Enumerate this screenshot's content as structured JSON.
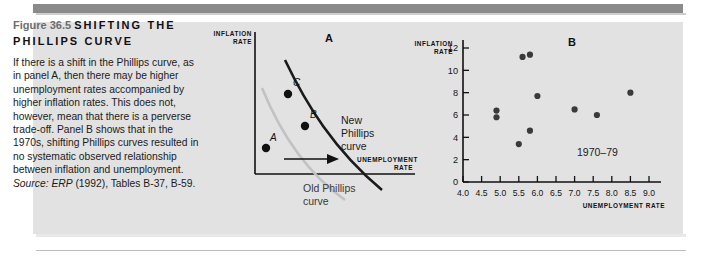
{
  "figure": {
    "number": "Figure 36.5",
    "title": "SHIFTING THE PHILLIPS CURVE",
    "body": "If there is a shift in the Phillips curve, as in panel A, then there may be higher unemployment rates accompanied by higher inflation rates. This does not, however, mean that there is a perverse trade-off. Panel B shows that in the 1970s, shifting Phillips curves resulted in no systematic observed relationship between inflation and unemployment.",
    "source_prefix": "Source:",
    "source_text": " ERP (1992), Tables B-37, B-59.",
    "source_italic": "ERP",
    "source_rest": " (1992), Tables B-37, B-59."
  },
  "panel_a": {
    "letter": "A",
    "y_axis_label": "INFLATION RATE",
    "x_axis_label": "UNEMPLOYMENT RATE",
    "new_curve_label": "New Phillips curve",
    "old_curve_label": "Old Phillips curve",
    "points": [
      {
        "label": "A"
      },
      {
        "label": "B"
      },
      {
        "label": "C"
      }
    ]
  },
  "panel_b": {
    "letter": "B",
    "y_axis_label": "INFLATION RATE",
    "x_axis_label": "UNEMPLOYMENT RATE",
    "annotation": "1970–79"
  },
  "chart_data": [
    {
      "type": "line",
      "title": "Panel A — Shifting the Phillips Curve",
      "xlabel": "UNEMPLOYMENT RATE",
      "ylabel": "INFLATION RATE",
      "grid": false,
      "legend": "inline labels",
      "series": [
        {
          "name": "Old Phillips curve",
          "color": "#b9b9b9",
          "points": [
            [
              0.14,
              0.72
            ],
            [
              0.3,
              0.46
            ],
            [
              0.5,
              0.24
            ],
            [
              0.78,
              0.08
            ]
          ]
        },
        {
          "name": "New Phillips curve",
          "color": "#1a1a1a",
          "points": [
            [
              0.3,
              0.88
            ],
            [
              0.48,
              0.62
            ],
            [
              0.68,
              0.36
            ],
            [
              0.95,
              0.12
            ]
          ]
        }
      ],
      "annotated_points": [
        {
          "label": "A",
          "series": "Old Phillips curve",
          "x": 0.3,
          "y": 0.34
        },
        {
          "label": "B",
          "series": "New Phillips curve",
          "x": 0.5,
          "y": 0.5
        },
        {
          "label": "C",
          "series": "New Phillips curve",
          "x": 0.38,
          "y": 0.68
        }
      ],
      "annotations": [
        "arrow pointing right from point A toward new curve"
      ]
    },
    {
      "type": "scatter",
      "title": "Panel B — Inflation vs Unemployment, 1970–79",
      "xlabel": "UNEMPLOYMENT RATE",
      "ylabel": "INFLATION RATE",
      "xlim": [
        4.0,
        9.0
      ],
      "ylim": [
        0,
        12
      ],
      "xticks": [
        "4.0",
        "4.5",
        "5.0",
        "5.5",
        "6.0",
        "6.5",
        "7.0",
        "7.5",
        "8.0",
        "8.5",
        "9.0"
      ],
      "yticks": [
        "0",
        "2",
        "4",
        "6",
        "8",
        "10",
        "12"
      ],
      "grid": false,
      "annotation": "1970–79",
      "x": [
        4.9,
        4.9,
        5.6,
        5.5,
        5.8,
        6.0,
        5.8,
        7.0,
        7.6,
        8.5
      ],
      "y": [
        6.4,
        5.8,
        11.2,
        3.4,
        11.4,
        7.7,
        4.6,
        6.5,
        6.0,
        8.0
      ],
      "points": [
        {
          "x": 4.9,
          "y": 6.4
        },
        {
          "x": 4.9,
          "y": 5.8
        },
        {
          "x": 5.6,
          "y": 11.2
        },
        {
          "x": 5.5,
          "y": 3.4
        },
        {
          "x": 5.8,
          "y": 11.4
        },
        {
          "x": 6.0,
          "y": 7.7
        },
        {
          "x": 5.8,
          "y": 4.6
        },
        {
          "x": 7.0,
          "y": 6.5
        },
        {
          "x": 7.6,
          "y": 6.0
        },
        {
          "x": 8.5,
          "y": 8.0
        }
      ]
    }
  ]
}
